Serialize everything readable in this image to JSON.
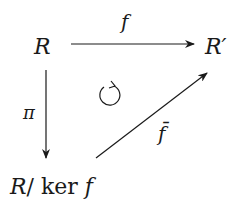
{
  "diagram": {
    "type": "commutative-diagram",
    "nodes": {
      "top_left": "R",
      "top_right": "R′",
      "bottom_left_R": "R",
      "bottom_left_rest": "/ ker ",
      "bottom_left_f": "f"
    },
    "arrows": {
      "horizontal": "f",
      "vertical": "π",
      "diagonal": "f̄"
    },
    "center_symbol": "commutes-cycle",
    "colors": {
      "ink": "#1a1a1a",
      "background": "#ffffff"
    }
  }
}
